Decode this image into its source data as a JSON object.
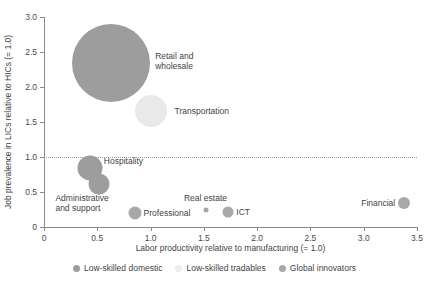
{
  "chart_data": {
    "type": "scatter",
    "title": "",
    "xlabel": "Labor productivity relative to manufacturing (= 1.0)",
    "ylabel": "Job prevalence in LICs relative to HICs (= 1.0)",
    "xlim": [
      0,
      3.5
    ],
    "ylim": [
      0,
      3.0
    ],
    "xticks": [
      "0",
      "0.5",
      "1.0",
      "1.5",
      "2.0",
      "2.5",
      "3.0",
      "3.5"
    ],
    "xtick_values": [
      0,
      0.5,
      1.0,
      1.5,
      2.0,
      2.5,
      3.0,
      3.5
    ],
    "yticks": [
      "0",
      "0.5",
      "1.0",
      "1.5",
      "2.0",
      "2.5",
      "3.0"
    ],
    "ytick_values": [
      0,
      0.5,
      1.0,
      1.5,
      2.0,
      2.5,
      3.0
    ],
    "grid": false,
    "reference_line": {
      "axis": "y",
      "value": 1.0,
      "style": "dotted"
    },
    "legend_position": "bottom",
    "bubble_note": "Marker area encodes sector employment share",
    "series": [
      {
        "name": "Low-skilled domestic",
        "color": "#9d9d9d",
        "points": [
          {
            "label": "Retail and\nwholesale",
            "x": 0.63,
            "y": 2.35,
            "size": 78
          },
          {
            "label": "Administrative\nand support",
            "x": 0.52,
            "y": 0.62,
            "size": 21
          },
          {
            "label": "Hospitality",
            "x": 0.43,
            "y": 0.85,
            "size": 25
          }
        ]
      },
      {
        "name": "Low-skilled tradables",
        "color": "#e9e9e9",
        "points": [
          {
            "label": "Transportation",
            "x": 1.0,
            "y": 1.66,
            "size": 32
          }
        ]
      },
      {
        "name": "Global innovators",
        "color": "#a8a8a8",
        "points": [
          {
            "label": "Professional",
            "x": 0.85,
            "y": 0.2,
            "size": 13
          },
          {
            "label": "Real estate",
            "x": 1.52,
            "y": 0.25,
            "size": 5
          },
          {
            "label": "ICT",
            "x": 1.73,
            "y": 0.22,
            "size": 11
          },
          {
            "label": "Financial",
            "x": 3.38,
            "y": 0.35,
            "size": 12
          }
        ]
      }
    ],
    "legend": [
      {
        "name": "Low-skilled domestic",
        "color": "#9d9d9d"
      },
      {
        "name": "Low-skilled tradables",
        "color": "#ececec"
      },
      {
        "name": "Global innovators",
        "color": "#a8a8a8"
      }
    ],
    "point_label_offsets": [
      {
        "label": "Retail and\nwholesale",
        "dx": 44,
        "dy": -12
      },
      {
        "label": "Transportation",
        "dx": 24,
        "dy": -5
      },
      {
        "label": "Hospitality",
        "dx": 14,
        "dy": -12
      },
      {
        "label": "Administrative\nand support",
        "dx": -44,
        "dy": 9
      },
      {
        "label": "Professional",
        "dx": 9,
        "dy": -5
      },
      {
        "label": "Real estate",
        "dx": -22,
        "dy": -17
      },
      {
        "label": "ICT",
        "dx": 8,
        "dy": -5
      },
      {
        "label": "Financial",
        "dx": -43,
        "dy": -5
      }
    ]
  }
}
